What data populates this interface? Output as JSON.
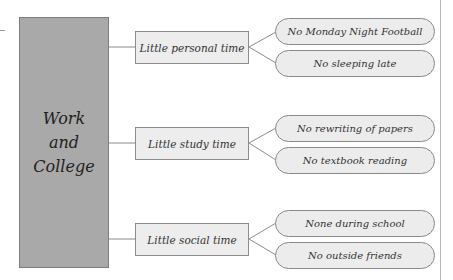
{
  "diagram": {
    "root": {
      "lines": [
        "Work",
        "and",
        "College"
      ]
    },
    "branches": [
      {
        "label": "Little personal time",
        "leaves": [
          "No Monday Night Football",
          "No sleeping late"
        ]
      },
      {
        "label": "Little study time",
        "leaves": [
          "No rewriting of papers",
          "No textbook reading"
        ]
      },
      {
        "label": "Little social time",
        "leaves": [
          "None during school",
          "No outside friends"
        ]
      }
    ],
    "colors": {
      "root_fill": "#a9a9a9",
      "box_fill": "#ededed",
      "border": "#8a8a8a",
      "line": "#8c8c8c"
    }
  }
}
